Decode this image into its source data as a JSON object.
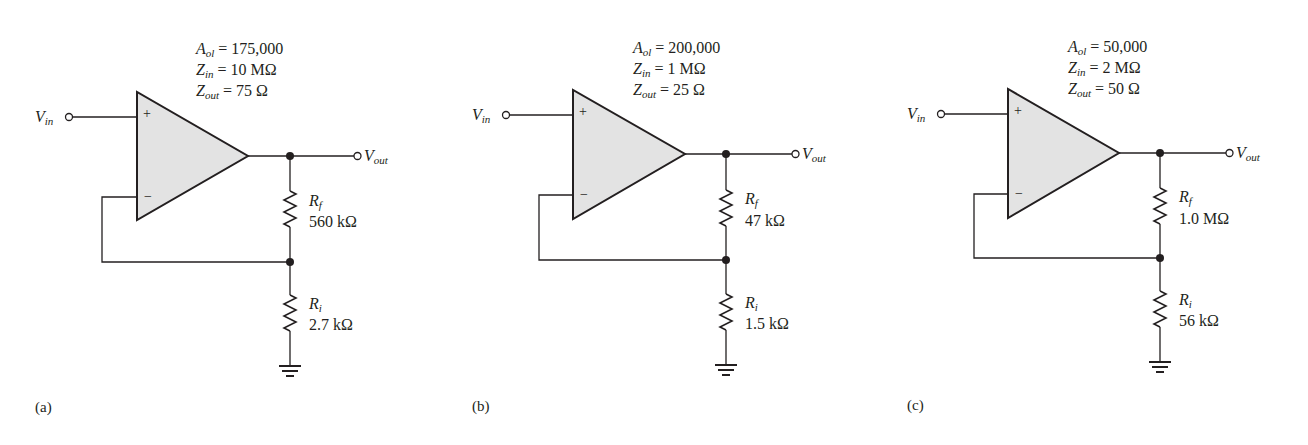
{
  "figure": {
    "panels": [
      {
        "id": "a",
        "label": "(a)",
        "params": {
          "aol_sym": "A",
          "aol_sub": "ol",
          "aol_val": "= 175,000",
          "zin_sym": "Z",
          "zin_sub": "in",
          "zin_val": "= 10 MΩ",
          "zout_sym": "Z",
          "zout_sub": "out",
          "zout_val": "= 75 Ω"
        },
        "vin": {
          "sym": "V",
          "sub": "in"
        },
        "vout": {
          "sym": "V",
          "sub": "out"
        },
        "rf": {
          "sym": "R",
          "sub": "f",
          "value": "560 kΩ"
        },
        "ri": {
          "sym": "R",
          "sub": "i",
          "value": "2.7 kΩ"
        },
        "plus": "+",
        "minus": "−"
      },
      {
        "id": "b",
        "label": "(b)",
        "params": {
          "aol_sym": "A",
          "aol_sub": "ol",
          "aol_val": "= 200,000",
          "zin_sym": "Z",
          "zin_sub": "in",
          "zin_val": "= 1 MΩ",
          "zout_sym": "Z",
          "zout_sub": "out",
          "zout_val": "= 25 Ω"
        },
        "vin": {
          "sym": "V",
          "sub": "in"
        },
        "vout": {
          "sym": "V",
          "sub": "out"
        },
        "rf": {
          "sym": "R",
          "sub": "f",
          "value": "47 kΩ"
        },
        "ri": {
          "sym": "R",
          "sub": "i",
          "value": "1.5 kΩ"
        },
        "plus": "+",
        "minus": "−"
      },
      {
        "id": "c",
        "label": "(c)",
        "params": {
          "aol_sym": "A",
          "aol_sub": "ol",
          "aol_val": "= 50,000",
          "zin_sym": "Z",
          "zin_sub": "in",
          "zin_val": "= 2 MΩ",
          "zout_sym": "Z",
          "zout_sub": "out",
          "zout_val": "= 50 Ω"
        },
        "vin": {
          "sym": "V",
          "sub": "in"
        },
        "vout": {
          "sym": "V",
          "sub": "out"
        },
        "rf": {
          "sym": "R",
          "sub": "f",
          "value": "1.0 MΩ"
        },
        "ri": {
          "sym": "R",
          "sub": "i",
          "value": "56 kΩ"
        },
        "plus": "+",
        "minus": "−"
      }
    ],
    "colors": {
      "opamp_fill": "#e3e3e3",
      "stroke": "#231f20"
    }
  }
}
